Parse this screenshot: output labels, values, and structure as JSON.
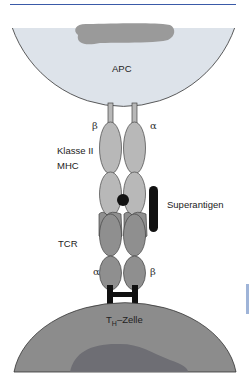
{
  "diagram": {
    "labels": {
      "apc": "APC",
      "mhc_line1": "Klasse II",
      "mhc_line2": "MHC",
      "superantigen": "Superantigen",
      "tcr": "TCR",
      "th_cell_prefix": "T",
      "th_cell_sub": "H",
      "th_cell_suffix": "–Zelle",
      "mhc_beta": "β",
      "mhc_alpha": "α",
      "tcr_alpha": "α",
      "tcr_beta": "β"
    },
    "colors": {
      "apc_fill": "#dde3ea",
      "apc_nucleus": "#9a9a9a",
      "th_fill": "#8c8c8c",
      "th_nucleus": "#6e6e74",
      "mhc_domain": "#b8b8b8",
      "tcr_domain": "#8f8f8f",
      "superantigen": "#111111",
      "accent_rule": "#3a5aa8"
    }
  }
}
